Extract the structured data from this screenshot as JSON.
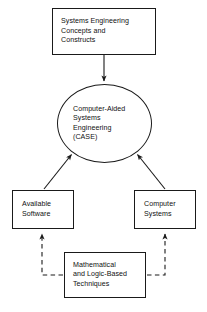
{
  "diagram": {
    "type": "flow-diagram",
    "background_color": "#ffffff",
    "stroke_color": "#1a1a1a",
    "text_color": "#111111",
    "nodes": [
      {
        "id": "systems-engineering",
        "shape": "rectangle",
        "label": "Systems Engineering\nConcepts and\nConstructs"
      },
      {
        "id": "case",
        "shape": "ellipse",
        "label": "Computer-Aided\nSystems\nEngineering\n(CASE)"
      },
      {
        "id": "available-software",
        "shape": "rectangle",
        "label": "Available\nSoftware"
      },
      {
        "id": "computer-systems",
        "shape": "rectangle",
        "label": "Computer\nSystems"
      },
      {
        "id": "mathematical-techniques",
        "shape": "rectangle",
        "label": "Mathematical\nand Logic-Based\nTechniques"
      }
    ],
    "edges": [
      {
        "id": "se-to-case",
        "from": "systems-engineering",
        "to": "case",
        "style": "solid",
        "arrow": "single"
      },
      {
        "id": "software-to-case",
        "from": "available-software",
        "to": "case",
        "style": "solid",
        "arrow": "single"
      },
      {
        "id": "computer-to-case",
        "from": "computer-systems",
        "to": "case",
        "style": "solid",
        "arrow": "single"
      },
      {
        "id": "math-to-software",
        "from": "mathematical-techniques",
        "to": "available-software",
        "style": "dashed",
        "arrow": "single"
      },
      {
        "id": "math-to-computer",
        "from": "mathematical-techniques",
        "to": "computer-systems",
        "style": "dashed",
        "arrow": "single"
      }
    ]
  }
}
